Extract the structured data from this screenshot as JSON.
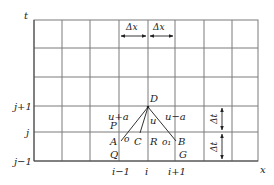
{
  "axes": {
    "t_label": "t",
    "x_label": "x"
  },
  "row_labels": {
    "j_plus_1": "j+1",
    "j": "j",
    "j_minus_1": "j−1"
  },
  "col_labels": {
    "i_minus_1": "i−1",
    "i": "i",
    "i_plus_1": "i+1"
  },
  "dimensions": {
    "dx1": "Δx",
    "dx2": "Δx",
    "dt1": "Δt",
    "dt2": "Δt"
  },
  "points": {
    "D": "D",
    "A": "A",
    "C": "C",
    "R": "R",
    "B": "B",
    "P": "P",
    "Q": "Q",
    "G": "G"
  },
  "characteristics": {
    "left": "u+a",
    "middle": "u",
    "right": "u−a"
  },
  "angles": {
    "theta": "o",
    "theta1": "o₁"
  },
  "colors": {
    "grid": "#7a7a7a",
    "lines": "#333333",
    "text": "#222222"
  }
}
